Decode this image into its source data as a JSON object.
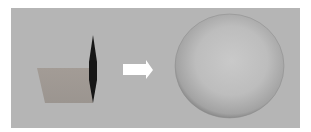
{
  "figure": {
    "colors": {
      "background": "#b5b5b5",
      "plane": "#a09a94",
      "edge_disk": "#1a1a1a",
      "arrow": "#ffffff",
      "sphere_light": "#c8c8c8",
      "sphere_shadow": "#6e6e6e"
    },
    "left_object": "plane-with-edge-on-disk",
    "arrow": "right-arrow",
    "right_object": "sphere"
  }
}
